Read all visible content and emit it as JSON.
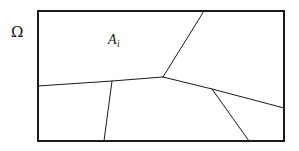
{
  "figure": {
    "kind": "geometric-partition-diagram",
    "background_color": "#ffffff",
    "line_color": "#1a1a1a",
    "label_color": "#151515",
    "width": 299,
    "height": 151
  },
  "labels": {
    "domain_symbol": "Ω",
    "region_base": "A",
    "region_subscript": "i"
  },
  "boundary": {
    "name": "outer-rectangle",
    "x": 38,
    "y": 11,
    "width": 246,
    "height": 130,
    "stroke_width": 1.1
  },
  "vertices": {
    "junction_center": [
      163,
      77
    ],
    "junction_right": [
      212,
      89
    ],
    "branch_root_left": [
      112,
      81
    ],
    "top_edge_point": [
      204,
      11
    ],
    "left_edge_point": [
      38,
      86
    ],
    "right_edge_point": [
      284,
      108
    ],
    "bottom_edge_point_left": [
      104,
      141
    ],
    "bottom_edge_point_right": [
      249,
      141
    ]
  },
  "edges": [
    {
      "name": "edge-center-to-top",
      "points": "163,77 204,11",
      "stroke_width": 1.0
    },
    {
      "name": "edge-center-to-left",
      "points": "163,77 112,81 38,86",
      "stroke_width": 1.0
    },
    {
      "name": "edge-center-to-right",
      "points": "163,77 212,89 284,108",
      "stroke_width": 1.0
    },
    {
      "name": "edge-left-branch-to-bottom",
      "points": "112,81 104,141",
      "stroke_width": 1.0
    },
    {
      "name": "edge-right-branch-to-bottom",
      "points": "212,89 249,141",
      "stroke_width": 1.0
    }
  ]
}
